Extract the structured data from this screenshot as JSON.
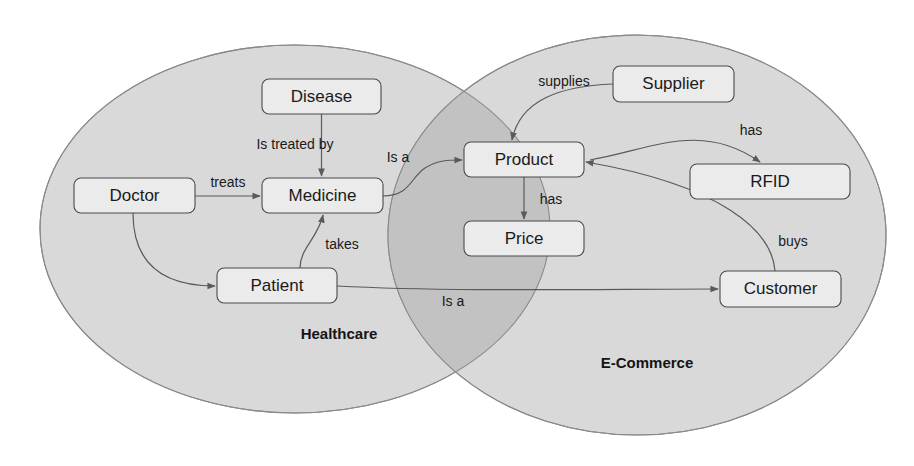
{
  "diagram": {
    "colors": {
      "background": "#ffffff",
      "ellipse_fill": "#d9d9d9",
      "ellipse_stroke": "#8a8a8a",
      "intersection_fill": "#c2c2c2",
      "node_fill": "#ebebeb",
      "node_stroke": "#4a4a4a",
      "edge_stroke": "#5a5a5a",
      "text": "#1a1a1a"
    },
    "regions": [
      {
        "id": "healthcare",
        "label": "Healthcare",
        "label_x": 339,
        "label_y": 335,
        "cx": 295,
        "cy": 229,
        "rx": 255,
        "ry": 184
      },
      {
        "id": "ecommerce",
        "label": "E-Commerce",
        "label_x": 647,
        "label_y": 364,
        "cx": 637,
        "cy": 235,
        "rx": 249,
        "ry": 200
      }
    ],
    "nodes": [
      {
        "id": "disease",
        "label": "Disease",
        "x": 262,
        "y": 79,
        "w": 119,
        "h": 35
      },
      {
        "id": "doctor",
        "label": "Doctor",
        "x": 74,
        "y": 178,
        "w": 121,
        "h": 35
      },
      {
        "id": "medicine",
        "label": "Medicine",
        "x": 262,
        "y": 178,
        "w": 121,
        "h": 35
      },
      {
        "id": "patient",
        "label": "Patient",
        "x": 217,
        "y": 268,
        "w": 120,
        "h": 35
      },
      {
        "id": "product",
        "label": "Product",
        "x": 464,
        "y": 142,
        "w": 120,
        "h": 35
      },
      {
        "id": "price",
        "label": "Price",
        "x": 464,
        "y": 221,
        "w": 120,
        "h": 35
      },
      {
        "id": "supplier",
        "label": "Supplier",
        "x": 613,
        "y": 66,
        "w": 121,
        "h": 36
      },
      {
        "id": "rfid",
        "label": "RFID",
        "x": 690,
        "y": 164,
        "w": 160,
        "h": 35
      },
      {
        "id": "customer",
        "label": "Customer",
        "x": 720,
        "y": 271,
        "w": 121,
        "h": 36
      }
    ],
    "edges": [
      {
        "id": "disease-medicine",
        "from": "Disease",
        "to": "Medicine",
        "label": "Is treated by",
        "label_x": 295,
        "label_y": 145
      },
      {
        "id": "doctor-medicine",
        "from": "Doctor",
        "to": "Medicine",
        "label": "treats",
        "label_x": 228,
        "label_y": 183
      },
      {
        "id": "doctor-patient",
        "from": "Doctor",
        "to": "Patient",
        "label": "",
        "label_x": 0,
        "label_y": 0
      },
      {
        "id": "patient-medicine",
        "from": "Patient",
        "to": "Medicine",
        "label": "takes",
        "label_x": 342,
        "label_y": 245
      },
      {
        "id": "medicine-product",
        "from": "Medicine",
        "to": "Product",
        "label": "Is a",
        "label_x": 398,
        "label_y": 158
      },
      {
        "id": "product-price",
        "from": "Product",
        "to": "Price",
        "label": "has",
        "label_x": 551,
        "label_y": 200
      },
      {
        "id": "supplier-product",
        "from": "Supplier",
        "to": "Product",
        "label": "supplies",
        "label_x": 564,
        "label_y": 82
      },
      {
        "id": "product-rfid",
        "from": "Product",
        "to": "RFID",
        "label": "has",
        "label_x": 751,
        "label_y": 131
      },
      {
        "id": "patient-customer",
        "from": "Patient",
        "to": "Customer",
        "label": "Is a",
        "label_x": 453,
        "label_y": 302
      },
      {
        "id": "customer-product",
        "from": "Customer",
        "to": "Product",
        "label": "buys",
        "label_x": 793,
        "label_y": 242
      }
    ]
  }
}
